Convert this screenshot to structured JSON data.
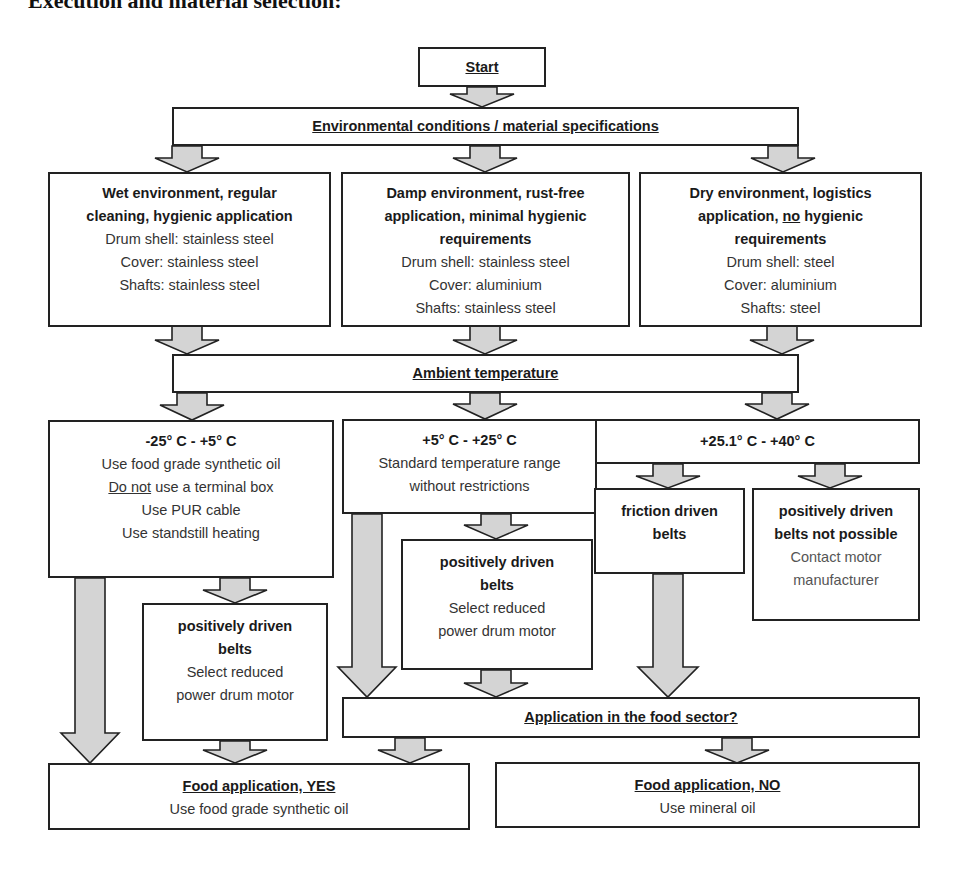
{
  "title": "Execution and material selection:",
  "start": {
    "label": "Start"
  },
  "environment": {
    "label": "Environmental conditions / material specifications",
    "options": [
      {
        "heading": [
          "Wet environment, regular",
          "cleaning, hygienic application"
        ],
        "details": [
          "Drum shell: stainless steel",
          "Cover: stainless steel",
          "Shafts: stainless steel"
        ]
      },
      {
        "heading": [
          "Damp environment, rust-free",
          "application, minimal hygienic",
          "requirements"
        ],
        "details": [
          "Drum shell: stainless steel",
          "Cover: aluminium",
          "Shafts: stainless steel"
        ]
      },
      {
        "heading_pre": "Dry environment, logistics",
        "heading_line2_pre": "application, ",
        "heading_line2_underlined": "no",
        "heading_line2_post": " hygienic",
        "heading_line3": "requirements",
        "details": [
          "Drum shell: steel",
          "Cover: aluminium",
          "Shafts: steel"
        ]
      }
    ]
  },
  "ambient": {
    "label": "Ambient temperature",
    "ranges": [
      {
        "heading": "-25° C - +5° C",
        "line1": "Use food grade synthetic oil",
        "line2_underlined": "Do not",
        "line2_rest": " use a terminal box",
        "line3": "Use PUR cable",
        "line4": "Use standstill heating"
      },
      {
        "heading": "+5° C - +25° C",
        "details": [
          "Standard temperature range",
          "without restrictions"
        ]
      },
      {
        "heading": "+25.1° C - +40° C"
      }
    ]
  },
  "belts": {
    "positively_left": {
      "heading": [
        "positively driven",
        "belts"
      ],
      "details": [
        "Select reduced",
        "power drum motor"
      ]
    },
    "positively_mid": {
      "heading": [
        "positively driven",
        "belts"
      ],
      "details": [
        "Select reduced",
        "power drum motor"
      ]
    },
    "friction": {
      "heading": [
        "friction driven",
        "belts"
      ]
    },
    "not_possible": {
      "heading": [
        "positively driven",
        "belts not possible"
      ],
      "details": [
        "Contact motor",
        "manufacturer"
      ]
    }
  },
  "food_sector": {
    "label": "Application in the food sector?"
  },
  "results": {
    "yes": {
      "heading": "Food application, YES",
      "detail": "Use food grade synthetic oil"
    },
    "no": {
      "heading": "Food application, NO",
      "detail": "Use mineral oil"
    }
  },
  "colors": {
    "arrow_fill": "#d4d4d4",
    "border": "#222222",
    "text": "#333333"
  }
}
